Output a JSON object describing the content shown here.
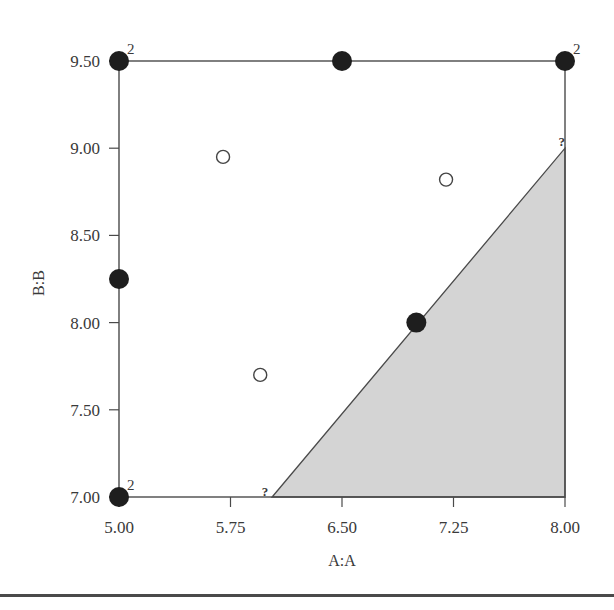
{
  "chart_data": {
    "type": "scatter",
    "title": "",
    "xlabel": "A:A",
    "ylabel": "B:B",
    "xlim": [
      5.0,
      8.0
    ],
    "ylim": [
      7.0,
      9.5
    ],
    "x_ticks": [
      "5.00",
      "5.75",
      "6.50",
      "7.25",
      "8.00"
    ],
    "y_ticks": [
      "7.00",
      "7.50",
      "8.00",
      "8.50",
      "9.00",
      "9.50"
    ],
    "grid": false,
    "legend": null,
    "series": [
      {
        "name": "design points (filled)",
        "marker": "filled-circle",
        "points": [
          {
            "x": 5.0,
            "y": 9.5,
            "label": "2"
          },
          {
            "x": 6.5,
            "y": 9.5,
            "label": ""
          },
          {
            "x": 8.0,
            "y": 9.5,
            "label": "2"
          },
          {
            "x": 5.0,
            "y": 8.25,
            "label": ""
          },
          {
            "x": 7.0,
            "y": 8.0,
            "label": ""
          },
          {
            "x": 5.0,
            "y": 7.0,
            "label": "2"
          }
        ]
      },
      {
        "name": "design points (open)",
        "marker": "open-circle",
        "points": [
          {
            "x": 5.7,
            "y": 8.95
          },
          {
            "x": 7.2,
            "y": 8.82
          },
          {
            "x": 5.95,
            "y": 7.7
          }
        ]
      }
    ],
    "shaded_region": {
      "description": "excluded constraint region (gray triangle)",
      "vertices": [
        [
          6.03,
          7.0
        ],
        [
          8.0,
          9.0
        ],
        [
          8.0,
          7.0
        ]
      ],
      "fill": "#d4d4d4",
      "vertex_labels": [
        {
          "x": 6.03,
          "y": 7.0,
          "label": "?"
        },
        {
          "x": 8.0,
          "y": 9.0,
          "label": "?"
        }
      ]
    },
    "annotations": [
      "2",
      "2",
      "2",
      "?",
      "?"
    ]
  },
  "colors": {
    "axis": "#4a4a4a",
    "filled_marker": "#1e1e1e",
    "open_marker_stroke": "#444444",
    "region_fill": "#d4d4d4",
    "text": "#3a3a3a"
  }
}
